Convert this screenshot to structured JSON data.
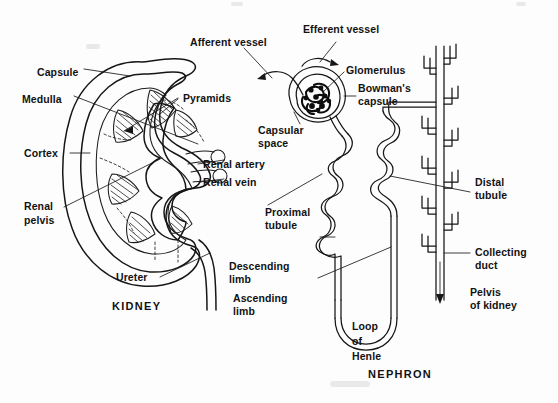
{
  "figure": {
    "title_kidney": "KIDNEY",
    "title_nephron": "NEPHRON",
    "ink_color": "#161616",
    "background_color": "#fdfdfd"
  },
  "kidney": {
    "caption": "KIDNEY",
    "labels": [
      {
        "id": "capsule",
        "text": "Capsule"
      },
      {
        "id": "medulla",
        "text": "Medulla"
      },
      {
        "id": "cortex",
        "text": "Cortex"
      },
      {
        "id": "renal_pelvis_1",
        "text": "Renal"
      },
      {
        "id": "renal_pelvis_2",
        "text": "pelvis"
      },
      {
        "id": "pyramids",
        "text": "Pyramids"
      },
      {
        "id": "renal_artery",
        "text": "Renal artery"
      },
      {
        "id": "renal_vein",
        "text": "Renal vein"
      },
      {
        "id": "ureter",
        "text": "Ureter"
      }
    ]
  },
  "nephron": {
    "caption": "NEPHRON",
    "labels": [
      {
        "id": "afferent_vessel",
        "text": "Afferent vessel"
      },
      {
        "id": "efferent_vessel",
        "text": "Efferent vessel"
      },
      {
        "id": "glomerulus",
        "text": "Glomerulus"
      },
      {
        "id": "bowmans_1",
        "text": "Bowman's"
      },
      {
        "id": "bowmans_2",
        "text": "capsule"
      },
      {
        "id": "capsular_1",
        "text": "Capsular"
      },
      {
        "id": "capsular_2",
        "text": "space"
      },
      {
        "id": "proximal_1",
        "text": "Proximal"
      },
      {
        "id": "proximal_2",
        "text": "tubule"
      },
      {
        "id": "descending_1",
        "text": "Descending"
      },
      {
        "id": "descending_2",
        "text": "limb"
      },
      {
        "id": "ascending_1",
        "text": "Ascending"
      },
      {
        "id": "ascending_2",
        "text": "limb"
      },
      {
        "id": "loop_1",
        "text": "Loop"
      },
      {
        "id": "loop_2",
        "text": "of"
      },
      {
        "id": "loop_3",
        "text": "Henle"
      },
      {
        "id": "distal_1",
        "text": "Distal"
      },
      {
        "id": "distal_2",
        "text": "tubule"
      },
      {
        "id": "collecting_1",
        "text": "Collecting"
      },
      {
        "id": "collecting_2",
        "text": "duct"
      },
      {
        "id": "pelvis_1",
        "text": "Pelvis"
      },
      {
        "id": "pelvis_2",
        "text": "of kidney"
      }
    ]
  }
}
